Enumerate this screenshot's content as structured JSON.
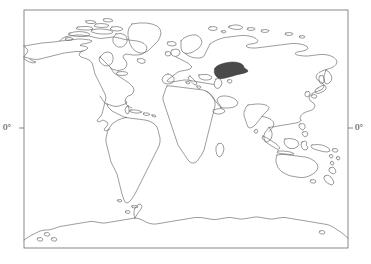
{
  "figure": {
    "type": "world-map",
    "projection": "plate-carree",
    "background_color": "#ffffff",
    "coastline_color": "#5a5a5a",
    "frame_color": "#6b6b6b",
    "highlight_color": "#4a4a4a",
    "frame": {
      "x": 24,
      "y": 10,
      "width": 324,
      "height": 238
    }
  },
  "axes": {
    "left_label": "0°",
    "right_label": "0°",
    "equator_y": 128,
    "tick_length": 5
  },
  "highlight": {
    "name": "central-asia-highlight",
    "region": "Central Asia / Caspian",
    "fill": "#4a4a4a",
    "bounds": {
      "x": 214,
      "y": 62,
      "width": 34,
      "height": 17
    }
  },
  "landmasses": [
    "north-america",
    "greenland",
    "south-america",
    "europe",
    "africa",
    "asia",
    "australia",
    "new-zealand",
    "antarctica",
    "indonesia",
    "japan",
    "madagascar",
    "british-isles",
    "iceland"
  ]
}
